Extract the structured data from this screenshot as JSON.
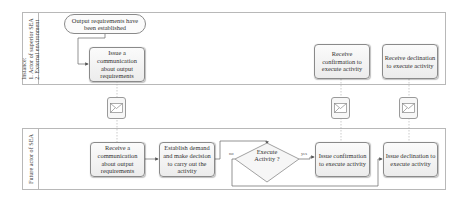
{
  "lanes": {
    "top": {
      "label": "Instance:\n1. Actor of superior SEA\n2. External environment"
    },
    "bottom": {
      "label": "Future actor of SEA"
    }
  },
  "top_lane": {
    "start_event": "Output requirements have been established",
    "issue_comm": "Issue a communication about output requirements",
    "receive_confirmation": "Receive confirmation to execute activity",
    "receive_declination": "Receive declination to execute activity"
  },
  "bottom_lane": {
    "receive_comm": "Receive a communication about output requirements",
    "establish_demand": "Establish demand and make decision to carry out the activity",
    "gateway": "Execute Activity ?",
    "gateway_no": "no",
    "gateway_yes": "yes",
    "issue_confirmation": "Issue confirmation to execute activity",
    "issue_declination": "Issue declination to execute activity"
  },
  "messages": [
    {
      "icon": "envelope-icon"
    },
    {
      "icon": "envelope-icon"
    },
    {
      "icon": "envelope-icon"
    }
  ],
  "colors": {
    "border": "#8a8a8a",
    "lane_border": "#b8b8b8",
    "task_fill": "#f2f2f2"
  }
}
